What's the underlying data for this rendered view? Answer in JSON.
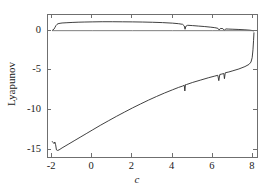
{
  "chart_data": {
    "type": "line",
    "title": "",
    "xlabel": "c",
    "ylabel": "Lyapunov",
    "xlim": [
      -2.2,
      8.3
    ],
    "ylim": [
      -16.2,
      2.0
    ],
    "xticks": [
      -2,
      0,
      2,
      4,
      6,
      8
    ],
    "xticklabels": [
      "-2",
      "0",
      "2",
      "4",
      "6",
      "8"
    ],
    "yticks": [
      0,
      -5,
      -10,
      -15
    ],
    "yticklabels": [
      "0",
      "-5",
      "-10",
      "-15"
    ],
    "grid": false,
    "legend": null,
    "line_color": "#2b2b2b",
    "frame_color": "#6f6f6f",
    "background": "#ffffff",
    "series": [
      {
        "name": "lambda-1 (upper Lyapunov exponent)",
        "color": "#2b2b2b",
        "points": [
          [
            -2.0,
            0.05
          ],
          [
            -1.95,
            0.1
          ],
          [
            -1.9,
            0.22
          ],
          [
            -1.85,
            0.45
          ],
          [
            -1.8,
            0.68
          ],
          [
            -1.75,
            0.82
          ],
          [
            -1.7,
            0.9
          ],
          [
            -1.6,
            0.95
          ],
          [
            -1.5,
            0.99
          ],
          [
            -1.3,
            1.02
          ],
          [
            -1.0,
            1.06
          ],
          [
            -0.7,
            1.09
          ],
          [
            -0.4,
            1.11
          ],
          [
            0.0,
            1.13
          ],
          [
            0.5,
            1.15
          ],
          [
            1.0,
            1.15
          ],
          [
            1.5,
            1.14
          ],
          [
            2.0,
            1.13
          ],
          [
            2.5,
            1.11
          ],
          [
            3.0,
            1.08
          ],
          [
            3.5,
            1.04
          ],
          [
            4.0,
            0.97
          ],
          [
            4.3,
            0.9
          ],
          [
            4.5,
            0.82
          ],
          [
            4.58,
            0.62
          ],
          [
            4.62,
            0.2
          ],
          [
            4.66,
            0.58
          ],
          [
            4.75,
            0.7
          ],
          [
            5.0,
            0.66
          ],
          [
            5.3,
            0.6
          ],
          [
            5.6,
            0.54
          ],
          [
            5.9,
            0.46
          ],
          [
            6.1,
            0.4
          ],
          [
            6.25,
            0.32
          ],
          [
            6.32,
            0.1
          ],
          [
            6.38,
            0.3
          ],
          [
            6.5,
            0.28
          ],
          [
            6.58,
            0.06
          ],
          [
            6.64,
            0.24
          ],
          [
            6.8,
            0.22
          ],
          [
            7.0,
            0.2
          ],
          [
            7.3,
            0.17
          ],
          [
            7.6,
            0.13
          ],
          [
            7.85,
            0.08
          ],
          [
            7.95,
            0.04
          ],
          [
            8.0,
            0.02
          ],
          [
            8.05,
            0.0
          ]
        ]
      },
      {
        "name": "lambda-2 (lower Lyapunov exponent)",
        "color": "#2b2b2b",
        "points": [
          [
            -2.0,
            -13.95
          ],
          [
            -1.95,
            -14.1
          ],
          [
            -1.9,
            -14.25
          ],
          [
            -1.86,
            -14.05
          ],
          [
            -1.82,
            -14.4
          ],
          [
            -1.78,
            -15.05
          ],
          [
            -1.72,
            -15.12
          ],
          [
            -1.65,
            -15.05
          ],
          [
            -1.5,
            -14.8
          ],
          [
            -1.2,
            -14.35
          ],
          [
            -0.9,
            -13.9
          ],
          [
            -0.6,
            -13.45
          ],
          [
            -0.3,
            -13.0
          ],
          [
            0.0,
            -12.55
          ],
          [
            0.4,
            -11.95
          ],
          [
            0.8,
            -11.38
          ],
          [
            1.2,
            -10.82
          ],
          [
            1.6,
            -10.28
          ],
          [
            2.0,
            -9.75
          ],
          [
            2.4,
            -9.25
          ],
          [
            2.8,
            -8.76
          ],
          [
            3.2,
            -8.3
          ],
          [
            3.6,
            -7.86
          ],
          [
            4.0,
            -7.45
          ],
          [
            4.3,
            -7.15
          ],
          [
            4.5,
            -6.98
          ],
          [
            4.58,
            -6.88
          ],
          [
            4.61,
            -7.6
          ],
          [
            4.64,
            -6.8
          ],
          [
            4.7,
            -6.78
          ],
          [
            5.0,
            -6.52
          ],
          [
            5.4,
            -6.22
          ],
          [
            5.8,
            -5.92
          ],
          [
            6.1,
            -5.72
          ],
          [
            6.25,
            -5.62
          ],
          [
            6.3,
            -6.3
          ],
          [
            6.35,
            -5.52
          ],
          [
            6.45,
            -5.46
          ],
          [
            6.55,
            -5.4
          ],
          [
            6.58,
            -6.05
          ],
          [
            6.62,
            -5.3
          ],
          [
            6.8,
            -5.2
          ],
          [
            7.0,
            -5.05
          ],
          [
            7.3,
            -4.82
          ],
          [
            7.6,
            -4.52
          ],
          [
            7.8,
            -4.25
          ],
          [
            7.9,
            -3.95
          ],
          [
            7.96,
            -3.4
          ],
          [
            8.0,
            -2.4
          ],
          [
            8.03,
            -1.2
          ],
          [
            8.05,
            -0.2
          ]
        ]
      },
      {
        "name": "zero-reference-trace",
        "color": "#6f6f6f",
        "points": [
          [
            -2.0,
            0.02
          ],
          [
            0.0,
            0.02
          ],
          [
            2.0,
            0.02
          ],
          [
            4.0,
            0.02
          ],
          [
            6.0,
            0.02
          ],
          [
            8.05,
            0.02
          ]
        ]
      }
    ]
  }
}
